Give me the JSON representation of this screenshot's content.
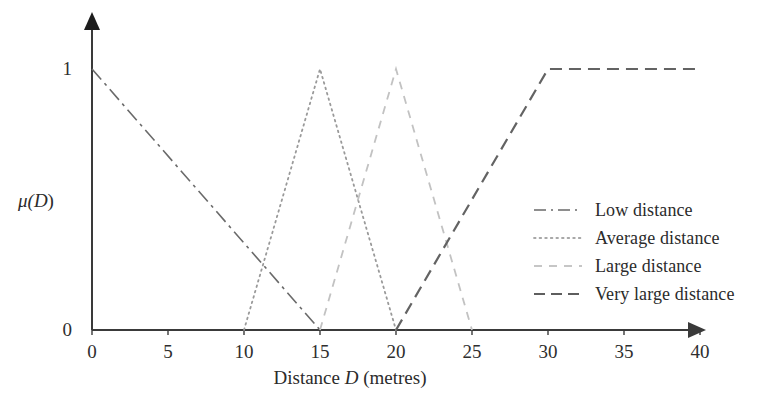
{
  "chart_data": {
    "type": "line",
    "title": "",
    "xlabel": "Distance D (metres)",
    "xlabel_prefix": "Distance ",
    "xlabel_var": "D",
    "xlabel_suffix": " (metres)",
    "ylabel": "μ(D)",
    "ylabel_prefix": "μ(",
    "ylabel_var": "D",
    "ylabel_suffix": ")",
    "xlim": [
      0,
      40
    ],
    "ylim": [
      0,
      1
    ],
    "xticks": [
      "0",
      "5",
      "10",
      "15",
      "20",
      "25",
      "30",
      "35",
      "40"
    ],
    "xtick_values": [
      0,
      5,
      10,
      15,
      20,
      25,
      30,
      35,
      40
    ],
    "yticks": [
      "0",
      "1"
    ],
    "ytick_values": [
      0,
      1
    ],
    "grid": false,
    "legend_position": "center-right",
    "series": [
      {
        "name": "Low distance",
        "style": "dashdot",
        "color": "#6a6a6a",
        "dasharray": "14,5,3,5",
        "width": 1.6,
        "points": [
          [
            0,
            1
          ],
          [
            15,
            0
          ]
        ]
      },
      {
        "name": "Average distance",
        "style": "dotted",
        "color": "#9a9a9a",
        "dasharray": "1.6,4",
        "width": 1.8,
        "points": [
          [
            10,
            0
          ],
          [
            15,
            1
          ],
          [
            20,
            0
          ]
        ]
      },
      {
        "name": "Large distance",
        "style": "dashed",
        "color": "#c2c2c2",
        "dasharray": "8,7",
        "width": 1.8,
        "points": [
          [
            15,
            0
          ],
          [
            20,
            1
          ],
          [
            25,
            0
          ]
        ]
      },
      {
        "name": "Very large distance",
        "style": "dashed",
        "color": "#636363",
        "dasharray": "12,7",
        "width": 2.2,
        "points": [
          [
            20,
            0
          ],
          [
            30,
            1
          ],
          [
            40,
            1
          ]
        ]
      }
    ]
  },
  "legend": {
    "items": [
      {
        "label": "Low distance",
        "swatch": "dashdot-dark"
      },
      {
        "label": "Average distance",
        "swatch": "dotted-light"
      },
      {
        "label": "Large distance",
        "swatch": "dashed-lighter"
      },
      {
        "label": "Very large distance",
        "swatch": "dashed-dark"
      }
    ]
  },
  "axes": {
    "x_tick_labels": [
      "0",
      "5",
      "10",
      "15",
      "20",
      "25",
      "30",
      "35",
      "40"
    ],
    "y_tick_labels": [
      "1",
      "0"
    ],
    "x_title_full": "Distance D (metres)",
    "y_title_full": "μ(D)"
  },
  "colors": {
    "axis": "#3a3a3a",
    "text": "#2b2b2b",
    "low": "#6a6a6a",
    "average": "#9a9a9a",
    "large": "#c2c2c2",
    "very_large": "#636363",
    "background": "#ffffff"
  }
}
